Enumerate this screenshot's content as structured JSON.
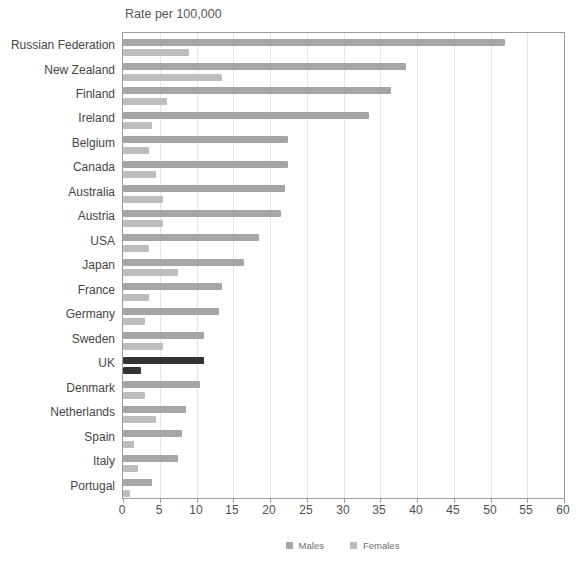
{
  "chart_data": {
    "type": "bar",
    "orientation": "horizontal",
    "title": "Rate per 100,000",
    "categories": [
      "Russian Federation",
      "New Zealand",
      "Finland",
      "Ireland",
      "Belgium",
      "Canada",
      "Australia",
      "Austria",
      "USA",
      "Japan",
      "France",
      "Germany",
      "Sweden",
      "UK",
      "Denmark",
      "Netherlands",
      "Spain",
      "Italy",
      "Portugal"
    ],
    "series": [
      {
        "name": "Males",
        "color": "#a5a5a5",
        "values": [
          52,
          38.5,
          36.5,
          33.5,
          22.5,
          22.5,
          22,
          21.5,
          18.5,
          16.5,
          13.5,
          13,
          11,
          11,
          10.5,
          8.5,
          8,
          7.5,
          4
        ]
      },
      {
        "name": "Females",
        "color": "#bdbdbd",
        "values": [
          9,
          13.5,
          6,
          4,
          3.5,
          4.5,
          5.5,
          5.5,
          3.5,
          7.5,
          3.5,
          3,
          5.5,
          2.5,
          3,
          4.5,
          1.5,
          2,
          1
        ]
      }
    ],
    "highlight": {
      "category": "UK",
      "color": "#333333"
    },
    "xlim": [
      0,
      60
    ],
    "x_ticks": [
      0,
      5,
      10,
      15,
      20,
      25,
      30,
      35,
      40,
      45,
      50,
      55,
      60
    ],
    "grid": true,
    "legend": [
      "Males",
      "Females"
    ],
    "legend_position": "bottom-center"
  },
  "colors": {
    "background": "#ffffff",
    "male_bar": "#a5a5a5",
    "female_bar": "#bdbdbd",
    "highlight_bar": "#333333",
    "gridline": "#e4e4e4",
    "plot_border": "#9c9c9c",
    "label_text": "#454545",
    "tick_text": "#4f4f4f",
    "legend_text": "#6e6e6e",
    "title_text": "#555555"
  }
}
